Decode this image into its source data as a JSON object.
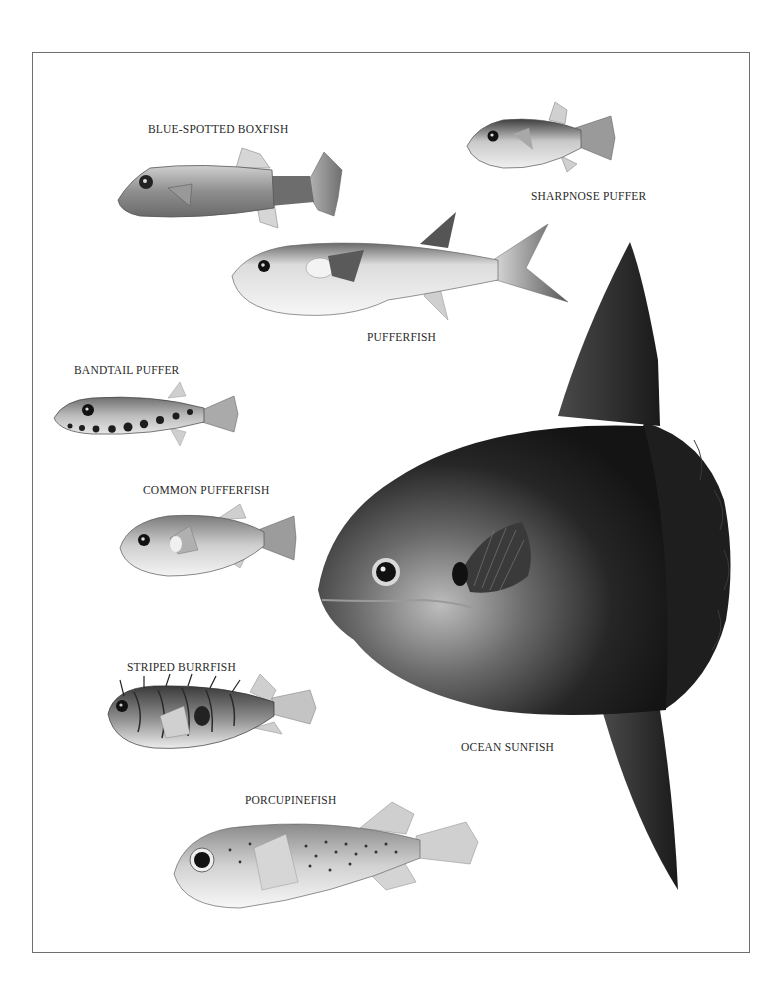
{
  "plate": {
    "labels": {
      "blue_spotted_boxfish": "BLUE-SPOTTED BOXFISH",
      "sharpnose_puffer": "SHARPNOSE PUFFER",
      "pufferfish": "PUFFERFISH",
      "bandtail_puffer": "BANDTAIL PUFFER",
      "common_pufferfish": "COMMON PUFFERFISH",
      "striped_burrfish": "STRIPED BURRFISH",
      "porcupinefish": "PORCUPINEFISH",
      "ocean_sunfish": "OCEAN SUNFISH"
    },
    "colors": {
      "border": "#6e6e6e",
      "text": "#2a2a2a",
      "sunfish_dark": "#1c1c1c",
      "light_body": "#e6e6e6"
    }
  }
}
